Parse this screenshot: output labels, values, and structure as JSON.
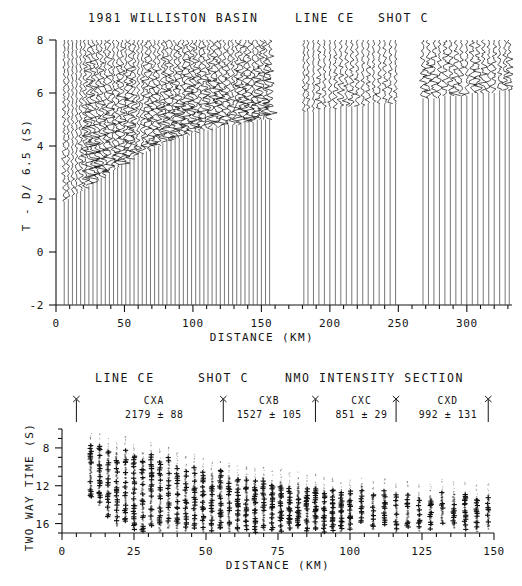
{
  "figure": {
    "background": "#ffffff",
    "ink": "#141414"
  },
  "top_panel": {
    "title_left": "1981 WILLISTON BASIN",
    "title_mid": "LINE CE",
    "title_right": "SHOT C",
    "ylabel": "T - D/ 6.5 (S)",
    "xlabel": "DISTANCE (KM)",
    "yticks": [
      8,
      6,
      4,
      2,
      0,
      -2
    ],
    "ytick_labels": [
      "8",
      "6",
      "4",
      "2",
      "0",
      "-2"
    ],
    "xticks": [
      0,
      50,
      100,
      150,
      200,
      250,
      300
    ],
    "xtick_labels": [
      "0",
      "50",
      "100",
      "150",
      "200",
      "250",
      "300"
    ],
    "xlim": [
      0,
      333
    ],
    "ylim": [
      -2,
      8
    ]
  },
  "bottom_panel": {
    "title_left": "LINE CE",
    "title_mid": "SHOT C",
    "title_right": "NMO INTENSITY SECTION",
    "ylabel": "TWO WAY TIME (S)",
    "xlabel": "DISTANCE (KM)",
    "yticks": [
      8,
      12,
      16
    ],
    "ytick_labels": [
      "8",
      "12",
      "16"
    ],
    "xticks": [
      0,
      25,
      50,
      75,
      100,
      125,
      150
    ],
    "xtick_labels": [
      "0",
      "25",
      "50",
      "75",
      "100",
      "125",
      "150"
    ],
    "xlim": [
      0,
      150
    ],
    "ylim": [
      6,
      17
    ],
    "segments": [
      {
        "name": "CXA",
        "value": "2179",
        "pm": "±",
        "error": "88",
        "label_x": 32,
        "marker_x": 5
      },
      {
        "name": "CXB",
        "value": "1527",
        "pm": "±",
        "error": "105",
        "label_x": 72,
        "marker_x": 56
      },
      {
        "name": "CXC",
        "value": "851",
        "pm": "±",
        "error": "29",
        "label_x": 104,
        "marker_x": 88
      },
      {
        "name": "CXD",
        "value": "992",
        "pm": "±",
        "error": "131",
        "label_x": 134,
        "marker_x": 116
      }
    ],
    "segment_markers_x": [
      5,
      56,
      88,
      116,
      148
    ]
  },
  "chart_data": [
    {
      "type": "line",
      "title": "1981 WILLISTON BASIN   LINE CE   SHOT C",
      "xlabel": "DISTANCE (KM)",
      "ylabel": "T - D/ 6.5 (S)",
      "xlim": [
        0,
        333
      ],
      "ylim": [
        -2,
        8
      ],
      "grid": false,
      "legend": "none",
      "description": "Reduced-time seismic refraction record section; each trace is a vertical wiggle plotted at its source-receiver distance.",
      "trace_distances_km": [
        6,
        9,
        12,
        15,
        18,
        21,
        24,
        27,
        30,
        33,
        36,
        39,
        42,
        45,
        48,
        51,
        54,
        57,
        60,
        63,
        66,
        69,
        72,
        75,
        78,
        81,
        84,
        87,
        90,
        93,
        96,
        99,
        102,
        105,
        108,
        111,
        114,
        117,
        120,
        123,
        126,
        129,
        132,
        135,
        138,
        141,
        144,
        147,
        150,
        153,
        156,
        181,
        184,
        188,
        192,
        196,
        200,
        204,
        208,
        212,
        216,
        220,
        224,
        228,
        232,
        236,
        240,
        244,
        248,
        268,
        272,
        276,
        280,
        284,
        288,
        292,
        296,
        300,
        304,
        308,
        312,
        316,
        320,
        324,
        328,
        331
      ],
      "trace_first_break_s": [
        1.9,
        2.0,
        2.1,
        2.2,
        2.3,
        2.4,
        2.5,
        2.6,
        2.7,
        2.8,
        2.9,
        3.0,
        3.1,
        3.2,
        3.3,
        3.4,
        3.5,
        3.6,
        3.7,
        3.7,
        3.8,
        3.9,
        4.0,
        4.0,
        4.1,
        4.2,
        4.2,
        4.3,
        4.3,
        4.4,
        4.4,
        4.5,
        4.5,
        4.6,
        4.6,
        4.6,
        4.7,
        4.7,
        4.7,
        4.8,
        4.8,
        4.8,
        4.8,
        4.9,
        4.9,
        4.9,
        4.9,
        5.0,
        5.0,
        5.0,
        5.0,
        5.3,
        5.3,
        5.3,
        5.4,
        5.4,
        5.4,
        5.4,
        5.5,
        5.5,
        5.5,
        5.5,
        5.5,
        5.6,
        5.6,
        5.6,
        5.6,
        5.6,
        5.6,
        5.8,
        5.8,
        5.8,
        5.8,
        5.9,
        5.9,
        5.9,
        5.9,
        5.9,
        6.0,
        6.0,
        6.0,
        6.0,
        6.0,
        6.1,
        6.1,
        6.1
      ],
      "gaps_km": [
        [
          157,
          180
        ],
        [
          249,
          267
        ]
      ]
    },
    {
      "type": "scatter",
      "title": "LINE CE   SHOT C   NMO INTENSITY SECTION",
      "xlabel": "DISTANCE (KM)",
      "ylabel": "TWO WAY TIME (S)",
      "xlim": [
        0,
        150
      ],
      "ylim": [
        6,
        17
      ],
      "yaxis_inverted": true,
      "grid": false,
      "legend": "none",
      "description": "NMO intensity section: vertical columns of cross markers (stacked amplitude picks) at each CDP distance.",
      "columns_km": [
        10,
        13,
        16,
        19,
        22,
        25,
        28,
        31,
        34,
        37,
        40,
        43,
        46,
        49,
        52,
        55,
        58,
        61,
        64,
        67,
        70,
        73,
        76,
        79,
        82,
        85,
        88,
        91,
        94,
        97,
        100,
        104,
        108,
        112,
        116,
        120,
        124,
        128,
        132,
        136,
        140,
        144,
        148
      ],
      "column_top_s": [
        7.6,
        7.8,
        8.3,
        8.6,
        8.2,
        8.9,
        9.2,
        8.8,
        9.5,
        9.1,
        9.8,
        10.2,
        10.0,
        10.5,
        10.8,
        10.4,
        11.0,
        11.3,
        11.1,
        11.5,
        11.2,
        11.8,
        11.6,
        12.0,
        11.9,
        12.2,
        12.1,
        12.5,
        12.4,
        12.7,
        12.6,
        12.2,
        12.9,
        12.6,
        13.0,
        12.8,
        13.2,
        13.1,
        12.7,
        12.9,
        13.0,
        13.3,
        13.1
      ],
      "column_bottom_s": [
        13.2,
        14.0,
        15.2,
        16.3,
        15.8,
        16.6,
        16.8,
        16.2,
        16.9,
        16.5,
        16.9,
        16.8,
        16.6,
        16.9,
        16.8,
        16.5,
        16.9,
        16.8,
        16.7,
        16.9,
        16.6,
        16.8,
        16.9,
        16.7,
        16.5,
        16.8,
        16.6,
        16.9,
        16.7,
        16.8,
        16.6,
        15.8,
        16.6,
        16.2,
        16.8,
        16.3,
        16.7,
        16.5,
        16.0,
        16.4,
        16.6,
        16.8,
        16.5
      ],
      "annotations": [
        "CXA 2179 ± 88",
        "CXB 1527 ± 105",
        "CXC 851 ± 29",
        "CXD 992 ± 131"
      ]
    }
  ]
}
